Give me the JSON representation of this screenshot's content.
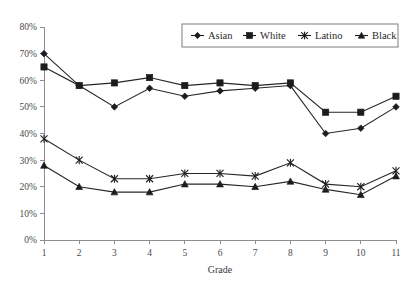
{
  "chart_data": {
    "type": "line",
    "title": "",
    "xlabel": "Grade",
    "ylabel": "",
    "x": [
      1,
      2,
      3,
      4,
      5,
      6,
      7,
      8,
      9,
      10,
      11
    ],
    "categories": [
      "1",
      "2",
      "3",
      "4",
      "5",
      "6",
      "7",
      "8",
      "9",
      "10",
      "11"
    ],
    "xtick_labels": [
      "1",
      "2",
      "3",
      "4",
      "5",
      "6",
      "7",
      "8",
      "9",
      "10",
      "11"
    ],
    "ytick_labels": [
      "0%",
      "10%",
      "20%",
      "30%",
      "40%",
      "50%",
      "60%",
      "70%",
      "80%"
    ],
    "ytick_values": [
      0,
      10,
      20,
      30,
      40,
      50,
      60,
      70,
      80
    ],
    "ylim": [
      0,
      80
    ],
    "xlim": [
      1,
      11
    ],
    "grid": false,
    "legend_position": "top-right",
    "series": [
      {
        "name": "Asian",
        "marker": "diamond",
        "color": "#1c1c1c",
        "values": [
          70,
          58,
          50,
          57,
          54,
          56,
          57,
          58,
          40,
          42,
          50
        ]
      },
      {
        "name": "White",
        "marker": "square",
        "color": "#1c1c1c",
        "values": [
          65,
          58,
          59,
          61,
          58,
          59,
          58,
          59,
          48,
          48,
          54
        ]
      },
      {
        "name": "Latino",
        "marker": "star",
        "color": "#1c1c1c",
        "values": [
          38,
          30,
          23,
          23,
          25,
          25,
          24,
          29,
          21,
          20,
          26
        ]
      },
      {
        "name": "Black",
        "marker": "triangle",
        "color": "#1c1c1c",
        "values": [
          28,
          20,
          18,
          18,
          21,
          21,
          20,
          22,
          19,
          17,
          24
        ]
      }
    ]
  },
  "legend": {
    "entries": [
      {
        "label": "Asian",
        "marker": "diamond"
      },
      {
        "label": "White",
        "marker": "square"
      },
      {
        "label": "Latino",
        "marker": "star"
      },
      {
        "label": "Black",
        "marker": "triangle"
      }
    ]
  }
}
